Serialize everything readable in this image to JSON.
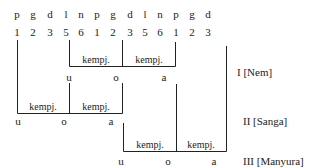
{
  "notation": {
    "pitches": [
      "p",
      "g",
      "d",
      "l",
      "n",
      "p",
      "g",
      "d",
      "l",
      "n",
      "p",
      "g",
      "d"
    ],
    "numbers": [
      "1",
      "2",
      "3",
      "5",
      "6",
      "1",
      "2",
      "3",
      "5",
      "6",
      "1",
      "2",
      "3"
    ]
  },
  "registers": [
    {
      "label": "I [Nem]",
      "kempyang": [
        "kempj.",
        "kempj."
      ],
      "vowels": [
        "u",
        "o",
        "a"
      ]
    },
    {
      "label": "II [Sanga]",
      "kempyang": [
        "kempj.",
        "kempj."
      ],
      "vowels": [
        "u",
        "o",
        "a"
      ]
    },
    {
      "label": "III [Manyura]",
      "kempyang": [
        "kempj.",
        "kempj."
      ],
      "vowels": [
        "u",
        "o",
        "a"
      ]
    }
  ]
}
